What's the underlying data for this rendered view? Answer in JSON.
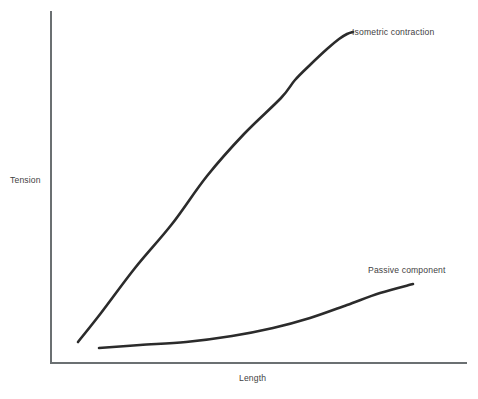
{
  "chart_data": {
    "type": "line",
    "title": "",
    "xlabel": "Length",
    "ylabel": "Tension",
    "grid": false,
    "legend_position": "inline-end-of-curve",
    "axis_color": "#6b7072",
    "curve_color": "#2b2b2b",
    "text_color": "#3f4243",
    "background": "#ffffff",
    "xlim": [
      0,
      1
    ],
    "ylim": [
      0,
      1
    ],
    "axis_ticks": {
      "x": [],
      "y": []
    },
    "series": [
      {
        "name": "Isometric contraction",
        "label": "Isometric contraction",
        "shape": "sigmoid",
        "x": [
          0.065,
          0.12,
          0.2,
          0.29,
          0.38,
          0.47,
          0.56,
          0.64,
          0.71,
          0.77,
          0.82,
          0.86,
          0.89
        ],
        "y": [
          0.06,
          0.14,
          0.28,
          0.42,
          0.56,
          0.68,
          0.79,
          0.87,
          0.92,
          0.95,
          0.97,
          0.975,
          0.98
        ],
        "path_points_px": [
          [
            78,
            342
          ],
          [
            101,
            313
          ],
          [
            135,
            268
          ],
          [
            172,
            224
          ],
          [
            207,
            176
          ],
          [
            244,
            134
          ],
          [
            281,
            98
          ],
          [
            295,
            80
          ],
          [
            311,
            64
          ],
          [
            327,
            49
          ],
          [
            339,
            39
          ],
          [
            347,
            34
          ],
          [
            353,
            32
          ]
        ]
      },
      {
        "name": "Passive component",
        "label": "Passive component",
        "shape": "exponential",
        "x": [
          0.12,
          0.22,
          0.33,
          0.44,
          0.54,
          0.63,
          0.72,
          0.8,
          0.87
        ],
        "y": [
          0.042,
          0.048,
          0.058,
          0.074,
          0.096,
          0.125,
          0.162,
          0.205,
          0.228
        ],
        "path_points_px": [
          [
            99,
            348
          ],
          [
            140,
            345
          ],
          [
            186,
            342
          ],
          [
            232,
            336
          ],
          [
            273,
            328
          ],
          [
            310,
            318
          ],
          [
            347,
            305
          ],
          [
            380,
            293
          ],
          [
            413,
            284
          ]
        ]
      }
    ]
  },
  "axes": {
    "y_axis_label": "Tension",
    "x_axis_label": "Length"
  },
  "annotations": {
    "isometric_label": "Isometric contraction",
    "passive_label": "Passive component"
  }
}
